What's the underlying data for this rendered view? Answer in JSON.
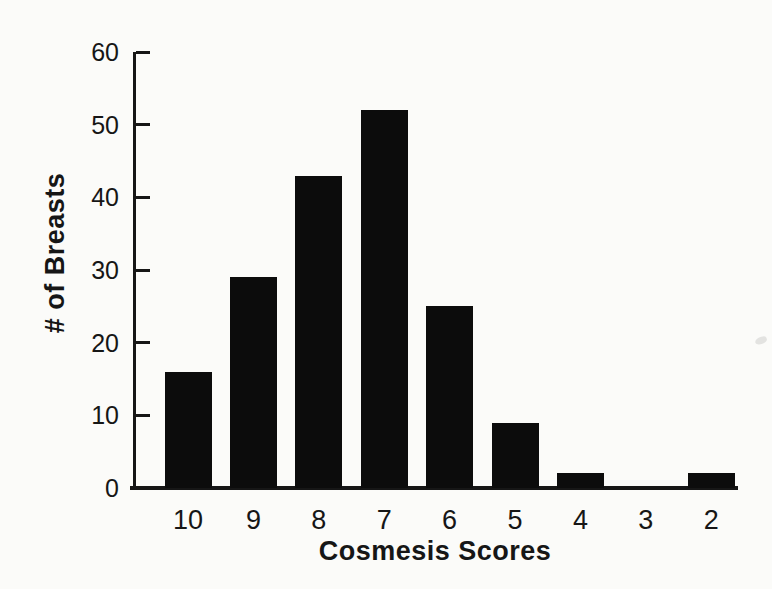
{
  "figure": {
    "background_color": "#fbfbf9",
    "ink_color": "#161616",
    "bar_color": "#0c0c0c"
  },
  "chart_data": {
    "type": "bar",
    "title": "",
    "categories": [
      "10",
      "9",
      "8",
      "7",
      "6",
      "5",
      "4",
      "3",
      "2"
    ],
    "values": [
      16,
      29,
      43,
      52,
      25,
      9,
      2,
      0,
      2
    ],
    "xlabel": "Cosmesis Scores",
    "ylabel": "# of Breasts",
    "ylim": [
      0,
      60
    ],
    "yticks": [
      0,
      10,
      20,
      30,
      40,
      50,
      60
    ],
    "tick_direction": "in",
    "grid": false,
    "legend": false,
    "bar_color": "#0c0c0c"
  }
}
